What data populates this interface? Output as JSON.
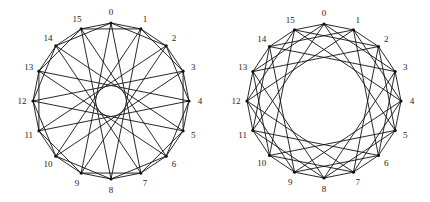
{
  "figure": {
    "width": 430,
    "height": 202,
    "graphs": [
      {
        "name": "left-circulant-graph",
        "vertex_count": 16,
        "jumps": [
          1,
          2,
          7
        ],
        "center": [
          111,
          101
        ],
        "radius": 78,
        "label_offset": 11,
        "labels": [
          "0",
          "1",
          "2",
          "3",
          "4",
          "5",
          "6",
          "7",
          "8",
          "9",
          "10",
          "11",
          "12",
          "13",
          "14",
          "15"
        ]
      },
      {
        "name": "right-circulant-graph",
        "vertex_count": 16,
        "jumps": [
          1,
          3,
          5
        ],
        "center": [
          324,
          101
        ],
        "radius": 77,
        "label_offset": 11,
        "labels": [
          "0",
          "1",
          "2",
          "3",
          "4",
          "5",
          "6",
          "7",
          "8",
          "9",
          "10",
          "11",
          "12",
          "13",
          "14",
          "15"
        ]
      }
    ],
    "colors": {
      "edge": "#111111",
      "vertex": "#111111",
      "label": "#222222",
      "background": "#ffffff"
    }
  }
}
